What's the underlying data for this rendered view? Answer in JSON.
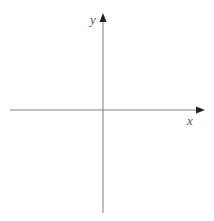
{
  "diagram": {
    "type": "cartesian-axes",
    "origin": {
      "x": 103,
      "y": 110
    },
    "x_axis": {
      "label": "x",
      "start": {
        "x": 10,
        "y": 110
      },
      "end": {
        "x": 205,
        "y": 110
      },
      "label_pos": {
        "left": 187,
        "top": 114
      }
    },
    "y_axis": {
      "label": "y",
      "start": {
        "x": 103,
        "y": 213
      },
      "end": {
        "x": 103,
        "y": 13
      },
      "label_pos": {
        "left": 90,
        "top": 13
      }
    },
    "colors": {
      "axis_line": "#808080",
      "arrowhead": "#222222",
      "label": "#555555",
      "background": "#ffffff"
    }
  }
}
